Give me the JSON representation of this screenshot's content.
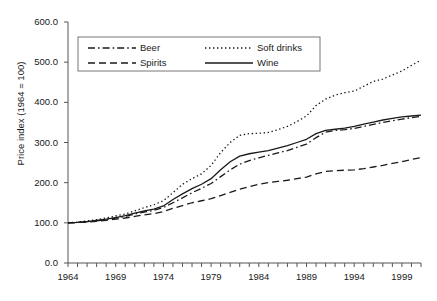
{
  "chart_data": {
    "type": "line",
    "title": "",
    "subtitle": "",
    "xlabel": "",
    "ylabel": "Price index (1964 = 100)",
    "xlim": [
      1964,
      2001
    ],
    "ylim": [
      0,
      600
    ],
    "grid": false,
    "legend_position": "top-left-inside",
    "ytick_labels": [
      "0.0",
      "100.0",
      "200.0",
      "300.0",
      "400.0",
      "500.0",
      "600.0"
    ],
    "ytick_values": [
      0,
      100,
      200,
      300,
      400,
      500,
      600
    ],
    "xtick_labels": [
      "1964",
      "1969",
      "1974",
      "1979",
      "1984",
      "1989",
      "1994",
      "1999"
    ],
    "xtick_values": [
      1964,
      1969,
      1974,
      1979,
      1984,
      1989,
      1994,
      1999
    ],
    "x_minor_tick_step": 1,
    "x": [
      1964,
      1965,
      1966,
      1967,
      1968,
      1969,
      1970,
      1971,
      1972,
      1973,
      1974,
      1975,
      1976,
      1977,
      1978,
      1979,
      1980,
      1981,
      1982,
      1983,
      1984,
      1985,
      1986,
      1987,
      1988,
      1989,
      1990,
      1991,
      1992,
      1993,
      1994,
      1995,
      1996,
      1997,
      1998,
      1999,
      2000,
      2001
    ],
    "series": [
      {
        "name": "Beer",
        "dash": "dash-dot",
        "color": "#1a1a1a",
        "values": [
          100,
          101,
          103,
          105,
          108,
          112,
          116,
          122,
          127,
          131,
          138,
          150,
          162,
          175,
          186,
          198,
          215,
          232,
          246,
          255,
          262,
          268,
          274,
          280,
          288,
          296,
          312,
          326,
          330,
          332,
          335,
          340,
          345,
          350,
          354,
          358,
          362,
          365
        ]
      },
      {
        "name": "Soft drinks",
        "dash": "dotted",
        "color": "#1a1a1a",
        "values": [
          100,
          102,
          105,
          108,
          112,
          117,
          122,
          130,
          138,
          145,
          155,
          175,
          196,
          210,
          222,
          243,
          275,
          300,
          318,
          322,
          323,
          325,
          332,
          340,
          352,
          366,
          392,
          408,
          418,
          424,
          428,
          440,
          452,
          458,
          468,
          478,
          492,
          505
        ]
      },
      {
        "name": "Spirits",
        "dash": "dashed",
        "color": "#1a1a1a",
        "values": [
          100,
          101,
          102,
          104,
          106,
          109,
          112,
          116,
          120,
          123,
          128,
          136,
          143,
          150,
          155,
          160,
          168,
          176,
          184,
          190,
          196,
          200,
          203,
          206,
          210,
          214,
          222,
          228,
          230,
          231,
          232,
          235,
          239,
          243,
          248,
          252,
          258,
          262
        ]
      },
      {
        "name": "Wine",
        "dash": "solid",
        "color": "#1a1a1a",
        "values": [
          100,
          101,
          103,
          106,
          109,
          113,
          118,
          124,
          130,
          134,
          142,
          158,
          172,
          185,
          196,
          210,
          232,
          252,
          266,
          272,
          276,
          280,
          286,
          292,
          300,
          308,
          322,
          330,
          333,
          336,
          340,
          346,
          351,
          356,
          360,
          364,
          366,
          368
        ]
      }
    ]
  },
  "axis": {
    "y_title": "Price index (1964 = 100)"
  },
  "legend": {
    "entries": [
      {
        "label": "Beer",
        "dash": "dash-dot"
      },
      {
        "label": "Soft drinks",
        "dash": "dotted"
      },
      {
        "label": "Spirits",
        "dash": "dashed"
      },
      {
        "label": "Wine",
        "dash": "solid"
      }
    ]
  }
}
